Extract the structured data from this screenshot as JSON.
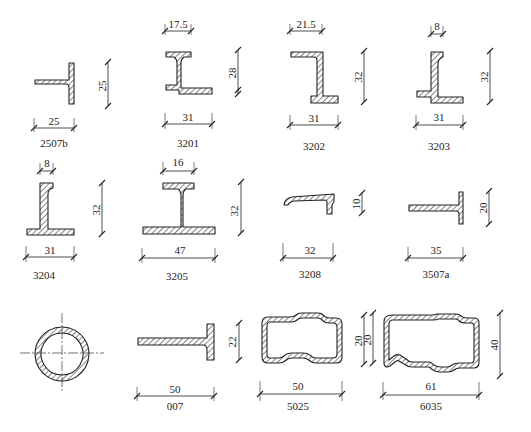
{
  "profiles": [
    {
      "id": "2507b",
      "label": "2507b",
      "width_dim": "25",
      "height_dim": "25"
    },
    {
      "id": "3201",
      "label": "3201",
      "width_dim": "31",
      "top_dim": "17.5",
      "height_dim": "28"
    },
    {
      "id": "3202",
      "label": "3202",
      "width_dim": "31",
      "top_dim": "21.5",
      "height_dim": "32"
    },
    {
      "id": "3203",
      "label": "3203",
      "width_dim": "31",
      "top_dim": "8",
      "height_dim": "32"
    },
    {
      "id": "3204",
      "label": "3204",
      "width_dim": "31",
      "top_dim": "8",
      "height_dim": "32"
    },
    {
      "id": "3205",
      "label": "3205",
      "width_dim": "47",
      "top_dim": "16",
      "height_dim": "32"
    },
    {
      "id": "3208",
      "label": "3208",
      "width_dim": "32",
      "height_dim": "10"
    },
    {
      "id": "3507a",
      "label": "3507a",
      "width_dim": "35",
      "height_dim": "20"
    },
    {
      "id": "tube",
      "label": ""
    },
    {
      "id": "007",
      "label": "007",
      "width_dim": "50",
      "height_dim": "22"
    },
    {
      "id": "5025",
      "label": "5025",
      "width_dim": "50",
      "height_dim": "20"
    },
    {
      "id": "6035",
      "label": "6035",
      "width_dim": "61",
      "height_dim": "40"
    }
  ],
  "colors": {
    "line": "#222222",
    "background": "#ffffff"
  }
}
